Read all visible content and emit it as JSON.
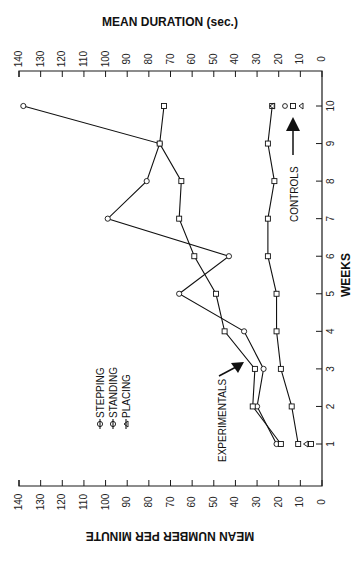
{
  "chart_data": {
    "type": "line",
    "orientation": "rotated 90 degrees counterclockwise (weeks axis vertical on right, value axes on top and bottom)",
    "top_axis_title": "MEAN DURATION (sec.)",
    "bottom_axis_title": "MEAN NUMBER PER MINUTE",
    "xlabel": "WEEKS",
    "x": [
      1,
      2,
      3,
      4,
      5,
      6,
      7,
      8,
      9,
      10
    ],
    "x_tick_labels": [
      "1",
      "2",
      "3",
      "4",
      "5",
      "6",
      "7",
      "8",
      "9",
      "10"
    ],
    "ylim": [
      0,
      140
    ],
    "y_tick_labels": [
      "140",
      "130",
      "120",
      "110",
      "100",
      "90",
      "80",
      "70",
      "60",
      "50",
      "40",
      "30",
      "20",
      "10",
      "0"
    ],
    "legend": [
      {
        "marker": "circle",
        "label": "STEPPING"
      },
      {
        "marker": "square",
        "label": "STANDING"
      },
      {
        "marker": "triangle",
        "label": "PLACING"
      }
    ],
    "series": [
      {
        "name": "Experimentals - Stepping",
        "marker": "circle",
        "values": [
          21,
          30,
          27,
          36,
          66,
          43,
          99,
          81,
          75,
          138
        ]
      },
      {
        "name": "Experimentals - Standing",
        "marker": "square",
        "values": [
          19,
          32,
          31,
          45,
          49,
          59,
          66,
          65,
          75,
          73
        ]
      },
      {
        "name": "Controls",
        "marker": "square",
        "values": [
          11,
          14,
          19,
          21,
          21,
          25,
          25,
          22,
          25,
          23
        ]
      }
    ],
    "extra_points": [
      {
        "week": 1,
        "marker": "square+triangle",
        "value": 6,
        "group": "Controls"
      },
      {
        "week": 10,
        "marker": "triangle",
        "value": 23,
        "group": "Controls"
      }
    ],
    "annotations": [
      {
        "text": "EXPERIMENTALS",
        "arrow": true
      },
      {
        "text": "CONTROLS",
        "arrow": true,
        "key_markers": [
          "circle",
          "square",
          "triangle"
        ]
      }
    ],
    "grid": false
  },
  "labels": {
    "top_title": "MEAN DURATION (sec.)",
    "bottom_title": "MEAN NUMBER PER MINUTE",
    "weeks_title": "WEEKS",
    "experimentals": "EXPERIMENTALS",
    "controls": "CONTROLS",
    "legend_stepping": "STEPPING",
    "legend_standing": "STANDING",
    "legend_placing": "PLACING"
  }
}
